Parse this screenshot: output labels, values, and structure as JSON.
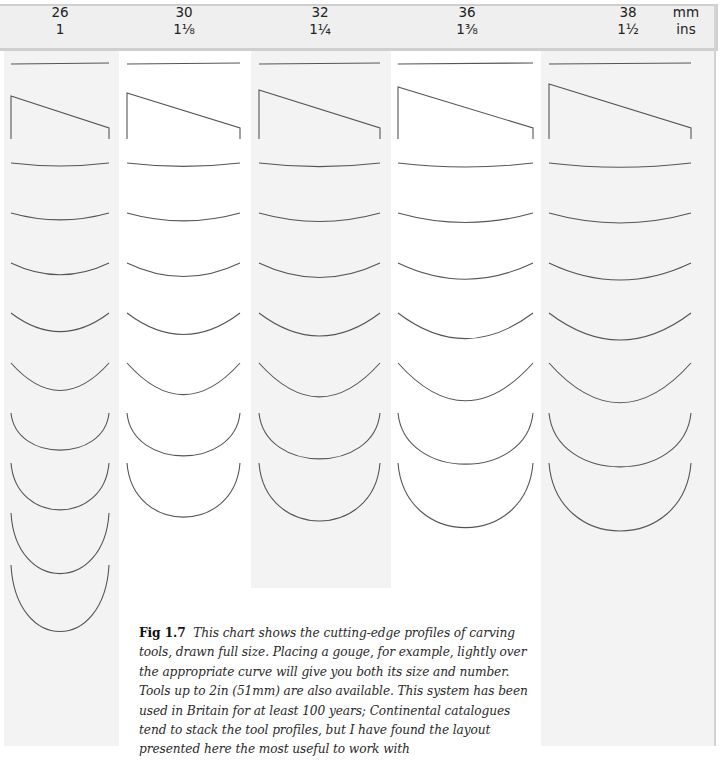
{
  "header": {
    "columns": [
      {
        "mm": "26",
        "ins": "1",
        "center_x": 60
      },
      {
        "mm": "30",
        "ins": "1⅛",
        "center_x": 184
      },
      {
        "mm": "32",
        "ins": "1¼",
        "center_x": 320
      },
      {
        "mm": "36",
        "ins": "1⅜",
        "center_x": 467
      },
      {
        "mm": "38",
        "ins": "1½",
        "center_x": 628
      }
    ],
    "unit_mm": "mm",
    "unit_ins": "ins"
  },
  "bands": [
    {
      "name": "col-26",
      "x": 4,
      "width": 115,
      "height": 695,
      "shade": "grey"
    },
    {
      "name": "col-30",
      "x": 119,
      "width": 132,
      "height": 695,
      "shade": "white"
    },
    {
      "name": "col-32",
      "x": 251,
      "width": 140,
      "height": 537,
      "shade": "grey"
    },
    {
      "name": "col-36",
      "x": 391,
      "width": 150,
      "height": 695,
      "shade": "white"
    },
    {
      "name": "col-38",
      "x": 541,
      "width": 173,
      "height": 695,
      "shade": "grey"
    }
  ],
  "profiles": {
    "stroke_color": "#555555",
    "columns": [
      {
        "mm": "26",
        "x1": 11,
        "x2": 109,
        "curve_count": 9
      },
      {
        "mm": "30",
        "x1": 127,
        "x2": 240,
        "curve_count": 7
      },
      {
        "mm": "32",
        "x1": 259,
        "x2": 380,
        "curve_count": 7
      },
      {
        "mm": "36",
        "x1": 398,
        "x2": 533,
        "curve_count": 7
      },
      {
        "mm": "38",
        "x1": 549,
        "x2": 691,
        "curve_count": 7
      }
    ],
    "row_labels": [
      "straight-chisel",
      "skew-chisel",
      "gouge-3",
      "gouge-4",
      "gouge-5",
      "gouge-6",
      "gouge-7",
      "gouge-8",
      "gouge-9",
      "gouge-10",
      "gouge-11"
    ]
  },
  "caption": {
    "fig_label": "Fig 1.7",
    "text": "This chart shows the cutting-edge profiles of carving tools, drawn full size. Placing a gouge, for example, lightly over the appropriate curve will give you both its size and number. Tools up to 2in (51mm) are also available. This system has been used in Britain for at least 100 years; Continental catalogues tend to stack the tool profiles, but I have found the layout presented here the most useful to work with"
  }
}
